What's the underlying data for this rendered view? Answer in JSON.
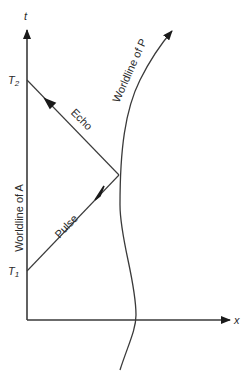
{
  "diagram": {
    "type": "spacetime-diagram",
    "axes": {
      "t_label": "t",
      "x_label": "x"
    },
    "events": {
      "t1_label": "T",
      "t1_sub": "1",
      "t2_label": "T",
      "t2_sub": "2"
    },
    "labels": {
      "worldline_a": "Worldline of A",
      "worldline_p": "Worldline of P",
      "pulse": "Pulse",
      "echo": "Echo"
    },
    "colors": {
      "ink": "#3a3a3a",
      "background": "#ffffff"
    }
  }
}
